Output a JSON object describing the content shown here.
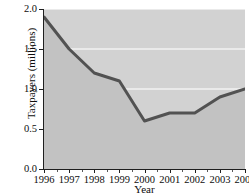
{
  "chart_data": {
    "type": "area",
    "title": "",
    "subtitle": "",
    "xlabel": "Year",
    "ylabel": "Taxpayers (millions)",
    "categories": [
      "1996",
      "1997",
      "1998",
      "1999",
      "2000",
      "2001",
      "2002",
      "2003",
      "2004"
    ],
    "x": [
      1996,
      1997,
      1998,
      1999,
      2000,
      2001,
      2002,
      2003,
      2004
    ],
    "values": [
      1.9,
      1.5,
      1.2,
      1.1,
      0.6,
      0.7,
      0.7,
      0.9,
      1.0
    ],
    "series": [
      {
        "name": "Taxpayers",
        "values": [
          1.9,
          1.5,
          1.2,
          1.1,
          0.6,
          0.7,
          0.7,
          0.9,
          1.0
        ]
      }
    ],
    "xlim": [
      1996,
      2004
    ],
    "ylim": [
      0.0,
      2.0
    ],
    "ytick_labels": [
      "0.0",
      "0.5",
      "1.0",
      "1.5",
      "2.0"
    ],
    "ytick_values": [
      0.0,
      0.5,
      1.0,
      1.5,
      2.0
    ],
    "xtick_labels": [
      "1996",
      "1997",
      "1998",
      "1999",
      "2000",
      "2001",
      "2002",
      "2003",
      "2004"
    ],
    "grid": true,
    "grid_axis": "y",
    "legend": false,
    "legend_position": "none",
    "annotations": [],
    "colors": {
      "plot_background": "#d2d2d2",
      "fill_below_line": "#c2c2c2",
      "gridline": "#f2f2f2",
      "line": "#525252",
      "axis": "#1f1f1f",
      "figure_background": "#ffffff",
      "text": "#0d0d0d"
    }
  },
  "axes": {
    "y_title": "Taxpayers (millions)",
    "x_title": "Year"
  }
}
